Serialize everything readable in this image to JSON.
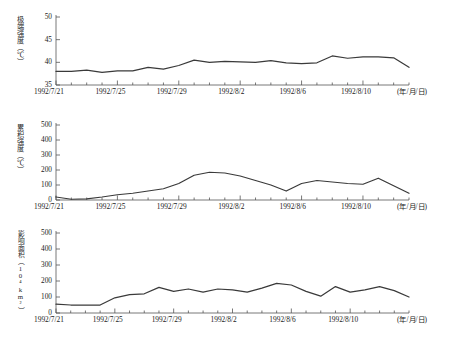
{
  "figure": {
    "background": "#ffffff",
    "line_color": "#3a3a3a",
    "axis_color": "#555555",
    "x_unit_label": "(年/月/日)"
  },
  "chart_data": [
    {
      "type": "line",
      "title": "",
      "ylabel": "极端强度（℃）",
      "xlabel": "(年/月/日)",
      "ylim": [
        35,
        50
      ],
      "yticks": [
        "35",
        "40",
        "45",
        "50"
      ],
      "ytick_values": [
        35,
        40,
        45,
        50
      ],
      "grid": false,
      "legend": "none",
      "x": [
        "1992/7/21",
        "1992/7/22",
        "1992/7/23",
        "1992/7/24",
        "1992/7/25",
        "1992/7/26",
        "1992/7/27",
        "1992/7/28",
        "1992/7/29",
        "1992/7/30",
        "1992/7/31",
        "1992/8/1",
        "1992/8/2",
        "1992/8/3",
        "1992/8/4",
        "1992/8/5",
        "1992/8/6",
        "1992/8/7",
        "1992/8/8",
        "1992/8/9",
        "1992/8/10",
        "1992/8/11",
        "1992/8/12"
      ],
      "xtick_labels": [
        "1992/7/21",
        "1992/7/25",
        "1992/7/29",
        "1992/8/2",
        "1992/8/6",
        "1992/8/10"
      ],
      "xtick_indices": [
        0,
        4,
        8,
        12,
        16,
        20
      ],
      "values": [
        38.0,
        38.0,
        38.3,
        37.8,
        38.1,
        38.1,
        38.9,
        38.5,
        39.3,
        40.5,
        40.0,
        40.2,
        40.1,
        40.0,
        40.4,
        39.9,
        39.7,
        39.9,
        41.4,
        40.9,
        41.2,
        41.2,
        41.0,
        38.9
      ]
    },
    {
      "type": "line",
      "title": "",
      "ylabel": "累积强度（℃）",
      "xlabel": "(年/月/日)",
      "ylim": [
        0,
        500
      ],
      "yticks": [
        "0",
        "100",
        "200",
        "300",
        "400",
        "500"
      ],
      "ytick_values": [
        0,
        100,
        200,
        300,
        400,
        500
      ],
      "grid": false,
      "legend": "none",
      "x": [
        "1992/7/21",
        "1992/7/22",
        "1992/7/23",
        "1992/7/24",
        "1992/7/25",
        "1992/7/26",
        "1992/7/27",
        "1992/7/28",
        "1992/7/29",
        "1992/7/30",
        "1992/7/31",
        "1992/8/1",
        "1992/8/2",
        "1992/8/3",
        "1992/8/4",
        "1992/8/5",
        "1992/8/6",
        "1992/8/7",
        "1992/8/8",
        "1992/8/9",
        "1992/8/10",
        "1992/8/11",
        "1992/8/12"
      ],
      "xtick_labels": [
        "1992/7/21",
        "1992/7/25",
        "1992/7/29",
        "1992/8/2",
        "1992/8/6",
        "1992/8/10"
      ],
      "xtick_indices": [
        0,
        4,
        8,
        12,
        16,
        20
      ],
      "values": [
        20,
        5,
        8,
        20,
        35,
        45,
        60,
        75,
        110,
        165,
        185,
        180,
        160,
        130,
        100,
        60,
        110,
        130,
        120,
        110,
        105,
        145,
        95,
        45
      ]
    },
    {
      "type": "line",
      "title": "",
      "ylabel": "影响面积（10⁴km²）",
      "xlabel": "(年/月/日)",
      "ylim": [
        0,
        500
      ],
      "yticks": [
        "0",
        "100",
        "200",
        "300",
        "400",
        "500"
      ],
      "ytick_values": [
        0,
        100,
        200,
        300,
        400,
        500
      ],
      "grid": false,
      "legend": "none",
      "x": [
        "1992/7/21",
        "1992/7/22",
        "1992/7/23",
        "1992/7/24",
        "1992/7/25",
        "1992/7/26",
        "1992/7/27",
        "1992/7/28",
        "1992/7/29",
        "1992/7/30",
        "1992/7/31",
        "1992/8/1",
        "1992/8/2",
        "1992/8/3",
        "1992/8/4",
        "1992/8/5",
        "1992/8/6",
        "1992/8/7",
        "1992/8/8",
        "1992/8/9",
        "1992/8/10",
        "1992/8/11",
        "1992/8/12"
      ],
      "xtick_labels": [
        "1992/7/21",
        "1992/7/25",
        "1992/7/29",
        "1992/8/2",
        "1992/8/6",
        "1992/8/10"
      ],
      "xtick_indices": [
        0,
        4,
        8,
        12,
        16,
        20
      ],
      "values": [
        55,
        50,
        50,
        50,
        95,
        115,
        120,
        160,
        135,
        150,
        130,
        150,
        145,
        130,
        155,
        185,
        175,
        135,
        105,
        165,
        130,
        145,
        165,
        140,
        100
      ]
    }
  ]
}
